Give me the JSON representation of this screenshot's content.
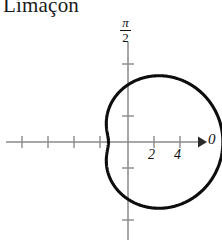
{
  "title": "Limaçon",
  "colors": {
    "curve": "#0d0d0d",
    "axis": "#8a8a8a",
    "text": "#111111",
    "background": "#ffffff"
  },
  "axes": {
    "x_arrow_label": "0",
    "y_axis_label_numerator": "π",
    "y_axis_label_denominator": "2",
    "x_ticks_labeled": [
      "2",
      "4"
    ]
  },
  "chart_data": {
    "type": "line",
    "title": "Limaçon",
    "plot_kind": "polar",
    "equation_form": "r = a + b·cos(θ)",
    "a": 4.4,
    "b": 2.9,
    "xlabel": "0",
    "ylabel": "π/2",
    "xlim": [
      -8.5,
      6.0
    ],
    "ylim": [
      -5.5,
      5.5
    ],
    "x_tick_values": [
      -8,
      -6,
      -4,
      -2,
      2,
      4
    ],
    "x_tick_labels": [
      "",
      "",
      "",
      "",
      "2",
      "4"
    ],
    "y_tick_values": [
      -4,
      -2,
      2,
      4
    ],
    "y_tick_labels": [
      "",
      "",
      "",
      ""
    ],
    "grid": false,
    "legend": false,
    "unit_px": 13,
    "origin_px": [
      128,
      142
    ],
    "key_points": {
      "leftmost_x": -7.3,
      "dimple_right_x": 1.5,
      "top_y": 5.2,
      "bottom_y": -5.2
    }
  }
}
